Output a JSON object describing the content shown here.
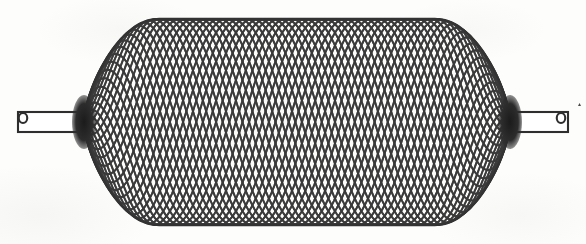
{
  "figure": {
    "kind": "technical-line-drawing",
    "background_color": "#fdfdfc",
    "ink_color": "#3a3a3a",
    "hub_color": "#262626",
    "width": 586,
    "height": 244
  },
  "geometry": {
    "center_y": 122,
    "left_hub_x": 84,
    "right_hub_x": 510,
    "barrel_left_x": 84,
    "barrel_right_x": 510,
    "barrel_top_y": 16,
    "barrel_bottom_y": 222,
    "barrel_half_height": 103,
    "shoulder_radius": 74,
    "filament_count": 30,
    "helix_turns": 2.15,
    "diamond_cell_width": 36,
    "diamond_cell_height": 27,
    "line_width": 1.9
  },
  "parts": {
    "left_hub": {
      "name": "left collar hub",
      "cx": 84,
      "cy": 122,
      "rx": 12,
      "ry": 27
    },
    "right_hub": {
      "name": "right collar hub",
      "cx": 510,
      "cy": 122,
      "rx": 12,
      "ry": 27
    },
    "left_shaft": {
      "name": "left shaft tube",
      "x_outer": 18,
      "x_inner": 86,
      "y_top": 112,
      "y_bottom": 132
    },
    "right_shaft": {
      "name": "right shaft tube",
      "x_inner": 508,
      "x_outer": 568,
      "y_top": 112,
      "y_bottom": 132
    },
    "left_tip": {
      "name": "left hooked tip loop",
      "cx": 23,
      "cy": 118,
      "r": 5
    },
    "right_tip": {
      "name": "right hooked tip loop",
      "cx": 561,
      "cy": 118,
      "r": 5
    },
    "speck": {
      "name": "scan artifact speck",
      "x": 578,
      "y": 106
    }
  },
  "ghost_marks": {
    "left": "",
    "right": ""
  }
}
